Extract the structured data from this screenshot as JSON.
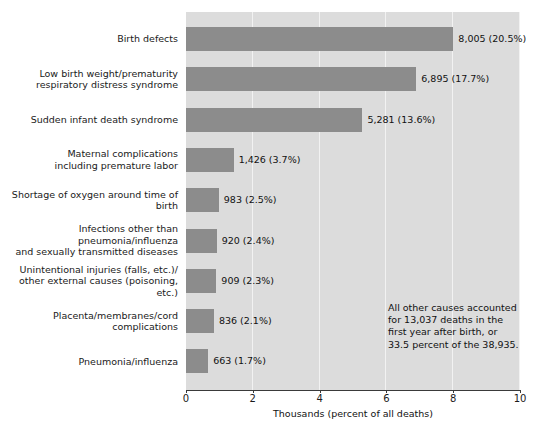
{
  "chart_data": {
    "type": "bar",
    "orientation": "horizontal",
    "title": "",
    "xlabel": "Thousands (percent of all deaths)",
    "ylabel": "",
    "xlim": [
      0,
      10
    ],
    "xticks": [
      "0",
      "2",
      "4",
      "6",
      "8",
      "10"
    ],
    "xtick_values": [
      0,
      2,
      4,
      6,
      8,
      10
    ],
    "grid": true,
    "legend": null,
    "categories": [
      "Birth defects",
      "Low birth weight/prematurity\nrespiratory distress syndrome",
      "Sudden infant death syndrome",
      "Maternal complications\nincluding premature labor",
      "Shortage of oxygen around time of birth",
      "Infections other than pneumonia/influenza\nand sexually transmitted diseases",
      "Unintentional injuries (falls, etc.)/\nother external causes (poisoning, etc.)",
      "Placenta/membranes/cord complications",
      "Pneumonia/influenza"
    ],
    "values": [
      8.005,
      6.895,
      5.281,
      1.426,
      0.983,
      0.92,
      0.909,
      0.836,
      0.663
    ],
    "value_labels": [
      "8,005 (20.5%)",
      "6,895 (17.7%)",
      "5,281 (13.6%)",
      "1,426 (3.7%)",
      "983 (2.5%)",
      "920 (2.4%)",
      "909 (2.3%)",
      "836 (2.1%)",
      "663 (1.7%)"
    ],
    "counts": [
      8005,
      6895,
      5281,
      1426,
      983,
      920,
      909,
      836,
      663
    ],
    "percents": [
      20.5,
      17.7,
      13.6,
      3.7,
      2.5,
      2.4,
      2.3,
      2.1,
      1.7
    ],
    "annotation": "All other causes accounted\nfor 13,037 deaths in the\nfirst year after birth, or\n33.5 percent of the 38,935.",
    "colors": {
      "bar": "#8c8c8c",
      "plot_background": "#dcdcdc",
      "gridline": "#f2f2f2",
      "axis": "#3a3a3a",
      "text": "#111111",
      "page_background": "#ffffff"
    }
  }
}
